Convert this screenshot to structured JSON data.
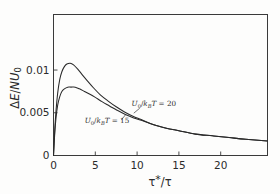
{
  "chart_data": {
    "type": "line",
    "title": "",
    "xlabel": "τ*/τ",
    "ylabel": "ΔE/NU₀",
    "xlim": [
      0,
      25.6
    ],
    "ylim": [
      0,
      0.0165
    ],
    "grid": false,
    "legend_position": "inline-annotations",
    "xticks": [
      "0",
      "5",
      "10",
      "15",
      "20"
    ],
    "xtick_values": [
      0,
      5,
      10,
      15,
      20
    ],
    "yticks": [
      "0",
      "0.005",
      "0.01"
    ],
    "ytick_values": [
      0,
      0.005,
      0.01
    ],
    "series": [
      {
        "name": "U0/kBT = 20",
        "label_text": "U₀/kʙT = 20",
        "peak_x": 2.0,
        "peak_y": 0.0108,
        "x": [
          0,
          0.15,
          0.3,
          0.5,
          0.75,
          1.0,
          1.3,
          1.6,
          2.0,
          2.4,
          2.9,
          3.4,
          4.0,
          4.8,
          5.6,
          6.5,
          7.5,
          8.5,
          9.5,
          10.5,
          12.0,
          13.5,
          15.0,
          17.0,
          19.0,
          21.0,
          23.0,
          25.6
        ],
        "y": [
          0,
          0.003,
          0.0052,
          0.0073,
          0.0089,
          0.0098,
          0.0104,
          0.0107,
          0.0108,
          0.0106,
          0.0101,
          0.0095,
          0.0088,
          0.0079,
          0.0071,
          0.0064,
          0.0057,
          0.0051,
          0.0046,
          0.0042,
          0.0036,
          0.0032,
          0.0029,
          0.0025,
          0.0023,
          0.0021,
          0.0019,
          0.0017
        ]
      },
      {
        "name": "U0/kBT = 15",
        "label_text": "U₀/kʙT = 15",
        "peak_x": 2.6,
        "peak_y": 0.008,
        "x": [
          0,
          0.15,
          0.3,
          0.5,
          0.75,
          1.0,
          1.3,
          1.7,
          2.1,
          2.6,
          3.1,
          3.7,
          4.3,
          5.0,
          5.8,
          6.7,
          7.6,
          8.6,
          9.6,
          10.6,
          12.0,
          13.5,
          15.0,
          17.0,
          19.0,
          21.0,
          23.0,
          25.6
        ],
        "y": [
          0,
          0.0026,
          0.0044,
          0.0059,
          0.0069,
          0.0075,
          0.0078,
          0.008,
          0.008,
          0.008,
          0.0078,
          0.0075,
          0.0072,
          0.0068,
          0.0063,
          0.0058,
          0.0053,
          0.0048,
          0.0044,
          0.0041,
          0.0036,
          0.0032,
          0.0029,
          0.0025,
          0.0023,
          0.0021,
          0.0019,
          0.0017
        ]
      }
    ],
    "annotations": [
      {
        "text": "U₀/kʙT = 20",
        "x": 12.0,
        "y": 0.0058
      },
      {
        "text": "U₀/kʙT = 15",
        "x": 6.4,
        "y": 0.0038
      }
    ],
    "colors": {
      "curve": "#2a2a2a",
      "axis": "#3a3a3a",
      "background": "#fdfdfc"
    }
  }
}
